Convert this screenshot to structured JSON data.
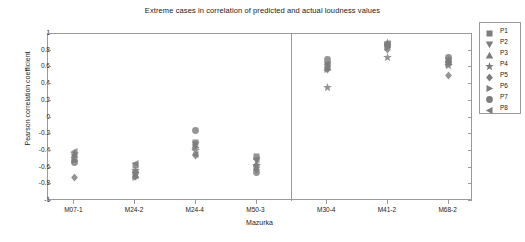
{
  "chart_data": {
    "type": "scatter",
    "title": "Extreme cases in correlation of predicted and actual loudness values",
    "xlabel": "Mazurka",
    "ylabel": "Pearson correlation coefficient",
    "ylim": [
      -1,
      1
    ],
    "ytick_labels": [
      "1",
      "0.8",
      "0.6",
      "0.4",
      "0.2",
      "0",
      "-0.2",
      "-0.4",
      "-0.6",
      "-0.8",
      "-1"
    ],
    "ytick_values": [
      1,
      0.8,
      0.6,
      0.4,
      0.2,
      0,
      -0.2,
      -0.4,
      -0.6,
      -0.8,
      -1
    ],
    "categories": [
      "M07-1",
      "M24-2",
      "M24-4",
      "M50-3",
      "M30-4",
      "M41-2",
      "M68-2"
    ],
    "grid": false,
    "legend_position": "right-outside",
    "marker_color": "#7d7d7d",
    "axis_color": "#9a9a9a",
    "divider_after_category": "M50-3",
    "legend": [
      {
        "name": "P1",
        "marker": "square"
      },
      {
        "name": "P2",
        "marker": "triangle-down"
      },
      {
        "name": "P3",
        "marker": "triangle-up"
      },
      {
        "name": "P4",
        "marker": "star"
      },
      {
        "name": "P5",
        "marker": "diamond"
      },
      {
        "name": "P6",
        "marker": "triangle-right"
      },
      {
        "name": "P7",
        "marker": "circle"
      },
      {
        "name": "P8",
        "marker": "triangle-left"
      }
    ],
    "series": [
      {
        "name": "P1",
        "marker": "square",
        "values": [
          -0.5,
          -0.58,
          -0.3,
          -0.47,
          0.62,
          0.86,
          0.66
        ]
      },
      {
        "name": "P2",
        "marker": "triangle-down",
        "values": [
          -0.47,
          -0.68,
          -0.32,
          -0.52,
          0.64,
          0.88,
          0.68
        ]
      },
      {
        "name": "P3",
        "marker": "triangle-up",
        "values": [
          -0.44,
          -0.7,
          -0.34,
          -0.55,
          0.6,
          0.9,
          0.7
        ]
      },
      {
        "name": "P4",
        "marker": "star",
        "values": [
          -0.43,
          -0.64,
          -0.4,
          -0.58,
          0.36,
          0.72,
          0.62
        ]
      },
      {
        "name": "P5",
        "marker": "diamond",
        "values": [
          -0.72,
          -0.71,
          -0.46,
          -0.62,
          0.57,
          0.82,
          0.5
        ]
      },
      {
        "name": "P6",
        "marker": "triangle-right",
        "values": [
          -0.52,
          -0.72,
          -0.36,
          -0.6,
          0.58,
          0.84,
          0.64
        ]
      },
      {
        "name": "P7",
        "marker": "circle",
        "values": [
          -0.54,
          -0.66,
          -0.15,
          -0.66,
          0.7,
          0.87,
          0.72
        ]
      },
      {
        "name": "P8",
        "marker": "triangle-left",
        "values": [
          -0.41,
          -0.55,
          -0.44,
          -0.5,
          0.63,
          0.89,
          0.67
        ]
      }
    ]
  }
}
